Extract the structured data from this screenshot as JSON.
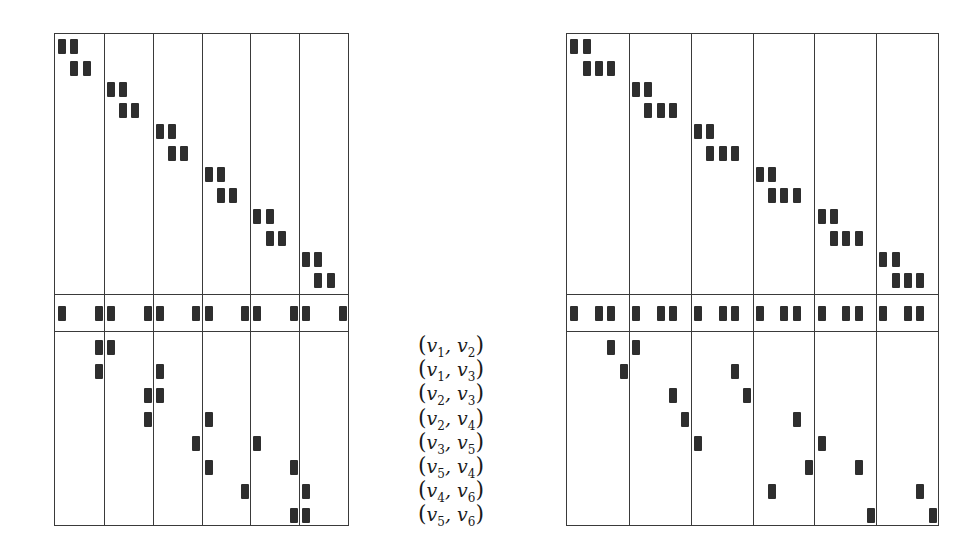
{
  "diagram": {
    "title": "",
    "edge_labels": [
      {
        "a": "v",
        "ai": "1",
        "b": "v",
        "bi": "2"
      },
      {
        "a": "v",
        "ai": "1",
        "b": "v",
        "bi": "3"
      },
      {
        "a": "v",
        "ai": "2",
        "b": "v",
        "bi": "3"
      },
      {
        "a": "v",
        "ai": "2",
        "b": "v",
        "bi": "4"
      },
      {
        "a": "v",
        "ai": "3",
        "b": "v",
        "bi": "5"
      },
      {
        "a": "v",
        "ai": "5",
        "b": "v",
        "bi": "4"
      },
      {
        "a": "v",
        "ai": "4",
        "b": "v",
        "bi": "6"
      },
      {
        "a": "v",
        "ai": "5",
        "b": "v",
        "bi": "6"
      }
    ],
    "edge_label_text": [
      "(v1, v2)",
      "(v1, v3)",
      "(v2, v3)",
      "(v2, v4)",
      "(v3, v5)",
      "(v5, v4)",
      "(v4, v6)",
      "(v5, v6)"
    ],
    "colors": {
      "line": "#3a3a3a",
      "block": "#2e2e2e",
      "background": "#ffffff"
    },
    "matrices": [
      {
        "name": "left-matrix",
        "box": {
          "x": 54,
          "y": 33,
          "w": 295,
          "h": 493
        },
        "num_blocks": 6,
        "subcols_per_block": 4,
        "hsep_y": [
          260,
          297
        ],
        "top_rows": {
          "y_offsets": [
            12,
            34
          ],
          "block_height": 126,
          "pattern": [
            [
              0,
              1
            ],
            [
              1,
              2
            ]
          ],
          "row_pitch_y": 42.5
        },
        "middle_band": {
          "y": 270,
          "subcols": [
            0,
            3
          ]
        },
        "bottom_rows": [
          [
            [
              0,
              3
            ],
            [
              1,
              0
            ]
          ],
          [
            [
              0,
              3
            ],
            [
              2,
              0
            ]
          ],
          [
            [
              1,
              3
            ],
            [
              2,
              0
            ]
          ],
          [
            [
              1,
              3
            ],
            [
              3,
              0
            ]
          ],
          [
            [
              2,
              3
            ],
            [
              4,
              0
            ]
          ],
          [
            [
              3,
              0
            ],
            [
              4,
              3
            ]
          ],
          [
            [
              3,
              3
            ],
            [
              5,
              0
            ]
          ],
          [
            [
              4,
              3
            ],
            [
              5,
              0
            ]
          ]
        ]
      },
      {
        "name": "right-matrix",
        "box": {
          "x": 566,
          "y": 33,
          "w": 373,
          "h": 493
        },
        "num_blocks": 6,
        "subcols_per_block": 5,
        "hsep_y": [
          260,
          297
        ],
        "top_rows": {
          "pattern": [
            [
              0,
              1
            ],
            [
              1,
              2,
              3
            ]
          ],
          "row_pitch_y": 42.5
        },
        "middle_band": {
          "y": 270,
          "subcols": [
            0,
            2,
            3
          ]
        },
        "bottom_rows": [
          [
            [
              0,
              3
            ],
            [
              1,
              0
            ]
          ],
          [
            [
              0,
              4
            ],
            [
              2,
              3
            ]
          ],
          [
            [
              1,
              3
            ],
            [
              2,
              4
            ]
          ],
          [
            [
              1,
              4
            ],
            [
              3,
              3
            ]
          ],
          [
            [
              2,
              0
            ],
            [
              4,
              0
            ]
          ],
          [
            [
              3,
              4
            ],
            [
              4,
              3
            ]
          ],
          [
            [
              3,
              1
            ],
            [
              5,
              3
            ]
          ],
          [
            [
              4,
              4
            ],
            [
              5,
              4
            ]
          ]
        ]
      }
    ]
  }
}
